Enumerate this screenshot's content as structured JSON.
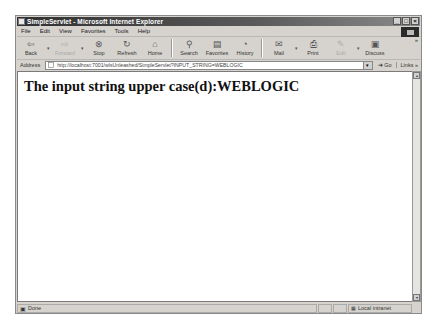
{
  "window": {
    "title": "SimpleServlet - Microsoft Internet Explorer",
    "controls": {
      "minimize": "_",
      "maximize": "□",
      "close": "×"
    }
  },
  "menu": {
    "items": [
      {
        "label": "File"
      },
      {
        "label": "Edit"
      },
      {
        "label": "View"
      },
      {
        "label": "Favorites"
      },
      {
        "label": "Tools"
      },
      {
        "label": "Help"
      }
    ]
  },
  "toolbar": {
    "buttons": [
      {
        "label": "Back",
        "icon": "back-arrow-icon",
        "glyph": "⇦",
        "enabled": true,
        "dropdown": true
      },
      {
        "label": "Forward",
        "icon": "forward-arrow-icon",
        "glyph": "⇨",
        "enabled": false,
        "dropdown": true
      },
      {
        "label": "Stop",
        "icon": "stop-icon",
        "glyph": "⊗",
        "enabled": true
      },
      {
        "label": "Refresh",
        "icon": "refresh-icon",
        "glyph": "↻",
        "enabled": true
      },
      {
        "label": "Home",
        "icon": "home-icon",
        "glyph": "⌂",
        "enabled": true
      },
      {
        "label": "Search",
        "icon": "search-icon",
        "glyph": "⚲",
        "enabled": true
      },
      {
        "label": "Favorites",
        "icon": "favorites-icon",
        "glyph": "▤",
        "enabled": true
      },
      {
        "label": "History",
        "icon": "history-icon",
        "glyph": "◔",
        "enabled": true
      },
      {
        "label": "Mail",
        "icon": "mail-icon",
        "glyph": "✉",
        "enabled": true,
        "dropdown": true
      },
      {
        "label": "Print",
        "icon": "print-icon",
        "glyph": "⎙",
        "enabled": true
      },
      {
        "label": "Edit",
        "icon": "edit-icon",
        "glyph": "✎",
        "enabled": false,
        "dropdown": true
      },
      {
        "label": "Discuss",
        "icon": "discuss-icon",
        "glyph": "▣",
        "enabled": true
      }
    ],
    "more": "»"
  },
  "address": {
    "label": "Address",
    "url": "http://localhost:7001/wlsUnleashed/SimpleServlet?INPUT_STRING=WEBLOGIC",
    "go_label": "Go",
    "links_label": "Links »"
  },
  "page": {
    "heading": "The input string upper case(d):WEBLOGIC"
  },
  "status": {
    "text": "Done",
    "zone": "Local intranet"
  }
}
